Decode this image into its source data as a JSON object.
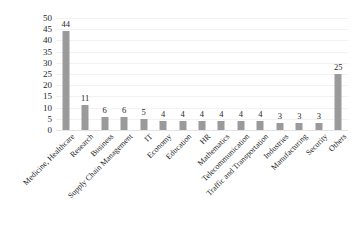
{
  "chart_data": {
    "type": "bar",
    "title": "",
    "subtitle": "",
    "xlabel": "",
    "ylabel": "",
    "ylim": [
      0,
      50
    ],
    "ytick_step": 5,
    "yticks": [
      50,
      45,
      40,
      35,
      30,
      25,
      20,
      15,
      10,
      5,
      0
    ],
    "grid": true,
    "legend": false,
    "bar_color": "#9a9a9a",
    "categories": [
      "Medicine, Healthcare",
      "Research",
      "Business",
      "Supply Chain Management",
      "IT",
      "Economy",
      "Education",
      "HR",
      "Mathematics",
      "Telecommunication",
      "Traffic and Transportation",
      "Industries",
      "Manufacturing",
      "Security",
      "Others"
    ],
    "values": [
      44,
      11,
      6,
      6,
      5,
      4,
      4,
      4,
      4,
      4,
      4,
      3,
      3,
      3,
      25
    ],
    "data_labels": [
      "44",
      "11",
      "6",
      "6",
      "5",
      "4",
      "4",
      "4",
      "4",
      "4",
      "4",
      "3",
      "3",
      "3",
      "25"
    ]
  }
}
